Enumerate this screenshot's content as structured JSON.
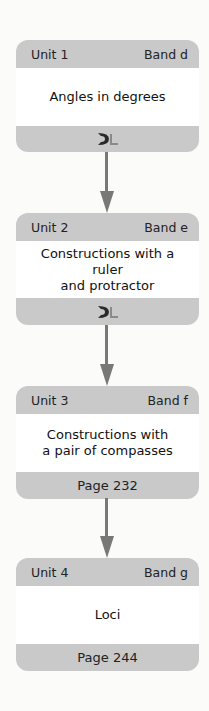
{
  "units": [
    {
      "unit": "Unit 1",
      "band": "Band d",
      "title": "Angles in degrees",
      "footer_icon": "dl-logo-icon",
      "page": null
    },
    {
      "unit": "Unit 2",
      "band": "Band e",
      "title": "Constructions with a ruler and protractor",
      "title_lines": [
        "Constructions with a ruler",
        "and protractor"
      ],
      "footer_icon": "dl-logo-icon",
      "page": null
    },
    {
      "unit": "Unit 3",
      "band": "Band f",
      "title": "Constructions with a pair of compasses",
      "title_lines": [
        "Constructions with",
        "a pair of compasses"
      ],
      "page": "Page 232"
    },
    {
      "unit": "Unit 4",
      "band": "Band g",
      "title": "Loci",
      "page": "Page 244"
    }
  ],
  "colors": {
    "box_gray": "#c9c9c9",
    "arrow_gray": "#787878",
    "body_white": "#ffffff"
  }
}
